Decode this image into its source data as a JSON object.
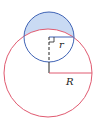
{
  "diagram": {
    "labels": {
      "small_radius": "r",
      "large_radius": "R"
    },
    "colors": {
      "large_circle_stroke": "#e05a70",
      "small_circle_stroke": "#3f63b5",
      "lens_fill": "#c9daf3",
      "radius_line": "#e05a70",
      "dashed_line": "#222222"
    },
    "shapes": {
      "large_circle": {
        "cx": 48,
        "cy": 73,
        "r": 44
      },
      "small_circle": {
        "cx": 49,
        "cy": 37,
        "r": 25
      }
    }
  }
}
